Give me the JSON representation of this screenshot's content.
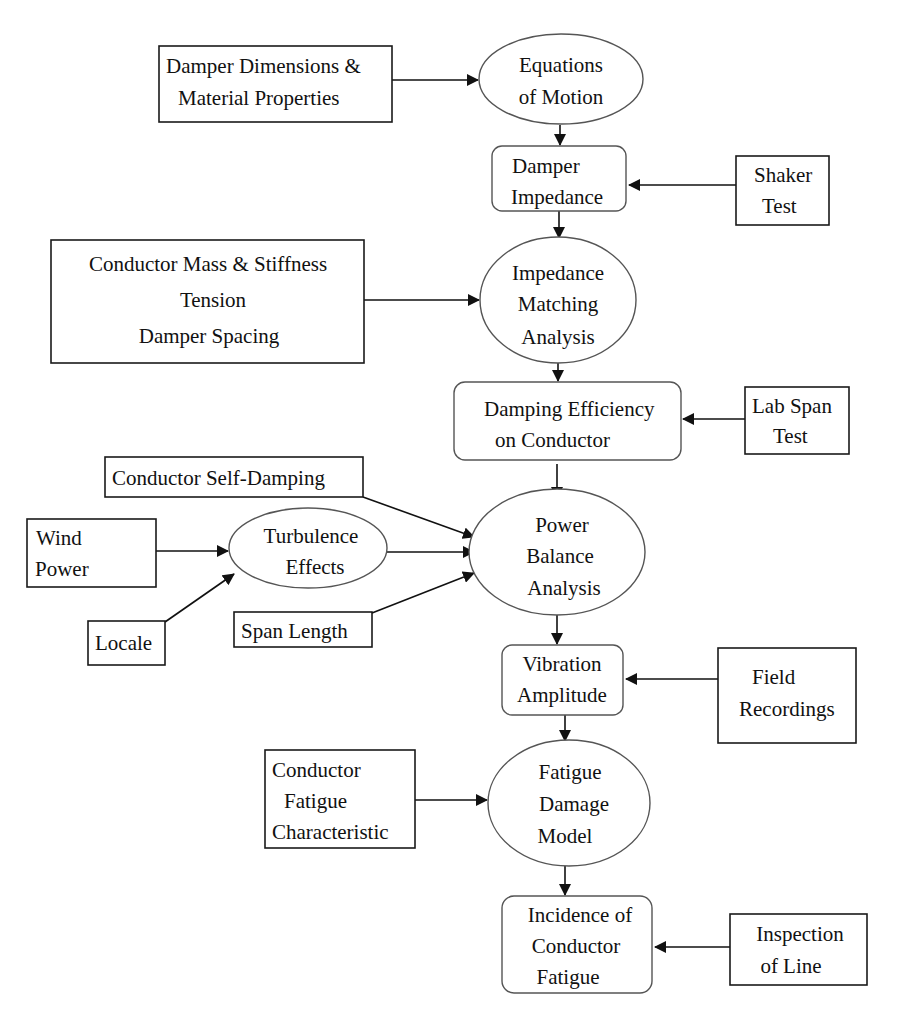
{
  "diagram": {
    "nodes": {
      "damper_dims": {
        "shape": "rect",
        "lines": [
          "Damper Dimensions &",
          "Material Properties"
        ]
      },
      "eq_motion": {
        "shape": "ellipse",
        "lines": [
          "Equations",
          "of Motion"
        ]
      },
      "damper_imp": {
        "shape": "rounded-rect",
        "lines": [
          "Damper",
          "Impedance"
        ]
      },
      "shaker": {
        "shape": "rect",
        "lines": [
          "Shaker",
          "Test"
        ]
      },
      "cond_mass": {
        "shape": "rect",
        "lines": [
          "Conductor Mass & Stiffness",
          "Tension",
          "Damper Spacing"
        ]
      },
      "imp_match": {
        "shape": "ellipse",
        "lines": [
          "Impedance",
          "Matching",
          "Analysis"
        ]
      },
      "damp_eff": {
        "shape": "rounded-rect",
        "lines": [
          "Damping Efficiency",
          "on Conductor"
        ]
      },
      "lab_span": {
        "shape": "rect",
        "lines": [
          "Lab Span",
          "Test"
        ]
      },
      "self_damp": {
        "shape": "rect",
        "lines": [
          "Conductor Self-Damping"
        ]
      },
      "wind": {
        "shape": "rect",
        "lines": [
          "Wind",
          "Power"
        ]
      },
      "turb": {
        "shape": "ellipse",
        "lines": [
          "Turbulence",
          "Effects"
        ]
      },
      "locale": {
        "shape": "rect",
        "lines": [
          "Locale"
        ]
      },
      "span_len": {
        "shape": "rect",
        "lines": [
          "Span Length"
        ]
      },
      "power_bal": {
        "shape": "ellipse",
        "lines": [
          "Power",
          "Balance",
          "Analysis"
        ]
      },
      "vib_amp": {
        "shape": "rounded-rect",
        "lines": [
          "Vibration",
          "Amplitude"
        ]
      },
      "field_rec": {
        "shape": "rect",
        "lines": [
          "Field",
          "Recordings"
        ]
      },
      "cond_fat": {
        "shape": "rect",
        "lines": [
          "Conductor",
          "Fatigue",
          "Characteristic"
        ]
      },
      "fat_model": {
        "shape": "ellipse",
        "lines": [
          "Fatigue",
          "Damage",
          "Model"
        ]
      },
      "incidence": {
        "shape": "rounded-rect",
        "lines": [
          "Incidence of",
          "Conductor",
          "Fatigue"
        ]
      },
      "inspection": {
        "shape": "rect",
        "lines": [
          "Inspection",
          "of Line"
        ]
      }
    },
    "edges": [
      {
        "from": "damper_dims",
        "to": "eq_motion"
      },
      {
        "from": "eq_motion",
        "to": "damper_imp"
      },
      {
        "from": "shaker",
        "to": "damper_imp"
      },
      {
        "from": "damper_imp",
        "to": "imp_match"
      },
      {
        "from": "cond_mass",
        "to": "imp_match"
      },
      {
        "from": "imp_match",
        "to": "damp_eff"
      },
      {
        "from": "lab_span",
        "to": "damp_eff"
      },
      {
        "from": "damp_eff",
        "to": "power_bal"
      },
      {
        "from": "self_damp",
        "to": "power_bal"
      },
      {
        "from": "wind",
        "to": "turb"
      },
      {
        "from": "locale",
        "to": "turb"
      },
      {
        "from": "turb",
        "to": "power_bal"
      },
      {
        "from": "span_len",
        "to": "power_bal"
      },
      {
        "from": "power_bal",
        "to": "vib_amp"
      },
      {
        "from": "field_rec",
        "to": "vib_amp"
      },
      {
        "from": "vib_amp",
        "to": "fat_model"
      },
      {
        "from": "cond_fat",
        "to": "fat_model"
      },
      {
        "from": "fat_model",
        "to": "incidence"
      },
      {
        "from": "inspection",
        "to": "incidence"
      }
    ]
  }
}
